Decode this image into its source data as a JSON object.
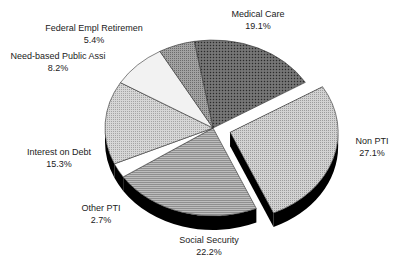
{
  "chart_data": {
    "type": "pie",
    "style": "3d-exploded",
    "title": "",
    "exploded": "Non PTI",
    "slices": [
      {
        "label": "Medical Care",
        "value": 19.1,
        "pct_label": "19.1%",
        "fill": "#5a5a5a",
        "pattern": "dense-dots"
      },
      {
        "label": "Non PTI",
        "value": 27.1,
        "pct_label": "27.1%",
        "fill": "#c4c4c4",
        "pattern": "fine-dots"
      },
      {
        "label": "Social Security",
        "value": 22.2,
        "pct_label": "22.2%",
        "fill": "#a8a8a8",
        "pattern": "horizontal-lines"
      },
      {
        "label": "Other PTI",
        "value": 2.7,
        "pct_label": "2.7%",
        "fill": "#ffffff",
        "pattern": "none"
      },
      {
        "label": "Interest on Debt",
        "value": 15.3,
        "pct_label": "15.3%",
        "fill": "#cfcfcf",
        "pattern": "fine-dots"
      },
      {
        "label": "Need-based Public Assi",
        "value": 8.2,
        "pct_label": "8.2%",
        "fill": "#f4f4f4",
        "pattern": "none"
      },
      {
        "label": "Federal Empl Retiremen",
        "value": 5.4,
        "pct_label": "5.4%",
        "fill": "#8e8e8e",
        "pattern": "medium-dots"
      }
    ],
    "legend": "none (labels placed around pie)"
  },
  "labels": {
    "medical": {
      "name": "Medical Care",
      "pct": "19.1%"
    },
    "nonpti": {
      "name": "Non PTI",
      "pct": "27.1%"
    },
    "social": {
      "name": "Social Security",
      "pct": "22.2%"
    },
    "otherpti": {
      "name": "Other PTI",
      "pct": "2.7%"
    },
    "interest": {
      "name": "Interest on Debt",
      "pct": "15.3%"
    },
    "needbased": {
      "name": "Need-based Public Assi",
      "pct": "8.2%"
    },
    "federal": {
      "name": "Federal Empl Retiremen",
      "pct": "5.4%"
    }
  }
}
